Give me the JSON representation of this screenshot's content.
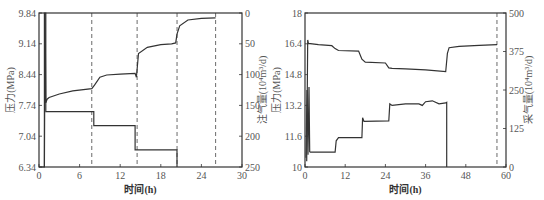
{
  "chart_data": [
    {
      "type": "line",
      "panel": "left",
      "xlabel": "时间(h)",
      "ylabel": "压力(MPa)",
      "y2label": "注气量(10⁴m³/d)",
      "xlim": [
        0,
        30
      ],
      "ylim": [
        6.34,
        9.84
      ],
      "y2lim": [
        250,
        0
      ],
      "xticks": [
        "0",
        "6",
        "12",
        "18",
        "24",
        "30"
      ],
      "yticks": [
        "6.34",
        "7.04",
        "7.74",
        "8.44",
        "9.14",
        "9.84"
      ],
      "y2ticks": [
        "0",
        "50",
        "100",
        "150",
        "200",
        "250"
      ],
      "dashed_vlines_x": [
        7.8,
        14.5,
        20.4,
        26.1
      ],
      "grid": false,
      "series": [
        {
          "name": "压力",
          "axis": "left",
          "x": [
            0.8,
            0.9,
            1.0,
            1.2,
            1.5,
            3,
            5,
            7.8,
            8.2,
            9,
            10,
            12,
            14.2,
            14.4,
            14.7,
            16,
            18,
            19.6,
            20.2,
            20.4,
            20.8,
            22,
            24,
            26.1
          ],
          "values": [
            6.34,
            9.84,
            7.8,
            7.88,
            7.92,
            8.0,
            8.07,
            8.12,
            8.2,
            8.38,
            8.43,
            8.45,
            8.47,
            8.38,
            8.92,
            9.06,
            9.12,
            9.14,
            9.16,
            9.36,
            9.55,
            9.68,
            9.72,
            9.73
          ]
        },
        {
          "name": "注气量",
          "axis": "right",
          "x": [
            0,
            0.8,
            0.8,
            1.0,
            1.0,
            8.1,
            8.1,
            14.2,
            14.2,
            20.4,
            20.4
          ],
          "values": [
            250,
            250,
            0,
            0,
            160,
            160,
            183,
            183,
            222,
            222,
            250
          ]
        }
      ]
    },
    {
      "type": "line",
      "panel": "right",
      "xlabel": "时间(h)",
      "ylabel": "压力(MPa)",
      "y2label": "采气量(10⁴m³/d)",
      "xlim": [
        0,
        60
      ],
      "ylim": [
        10,
        18
      ],
      "y2lim": [
        0,
        500
      ],
      "xticks": [
        "0",
        "12",
        "24",
        "36",
        "48",
        "60"
      ],
      "yticks": [
        "10",
        "11.6",
        "13.2",
        "14.8",
        "16.4",
        "18"
      ],
      "y2ticks": [
        "0",
        "125",
        "250",
        "375",
        "500"
      ],
      "dashed_vlines_x": [
        57.3
      ],
      "grid": false,
      "series": [
        {
          "name": "压力",
          "axis": "left",
          "x": [
            0.5,
            0.8,
            1.0,
            4,
            8,
            9,
            10,
            16,
            17,
            18,
            24,
            25,
            26,
            30,
            36,
            42,
            42.5,
            43,
            46,
            52,
            57.3
          ],
          "values": [
            10.3,
            16.6,
            16.42,
            16.36,
            16.3,
            16.15,
            16.05,
            16.02,
            15.6,
            15.45,
            15.4,
            15.15,
            15.12,
            15.1,
            15.05,
            14.95,
            15.9,
            16.2,
            16.27,
            16.32,
            16.36
          ]
        },
        {
          "name": "采气量",
          "axis": "right",
          "x": [
            0.3,
            0.6,
            0.9,
            1.2,
            1.4,
            1.6,
            9,
            9.3,
            10,
            17,
            17.2,
            17.6,
            25,
            25.3,
            26,
            30,
            34,
            35,
            36,
            38,
            40,
            42,
            42.3,
            42.3
          ],
          "values": [
            30,
            250,
            40,
            260,
            50,
            48,
            48,
            85,
            95,
            95,
            160,
            148,
            150,
            205,
            200,
            205,
            205,
            200,
            212,
            215,
            205,
            208,
            210,
            0
          ]
        }
      ]
    }
  ]
}
